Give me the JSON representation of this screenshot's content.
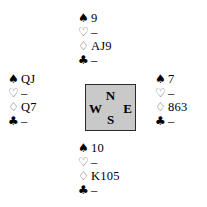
{
  "diagram": {
    "type": "bridge-deal-diagram",
    "suit_order": [
      "spade",
      "heart",
      "diamond",
      "club"
    ],
    "suit_glyphs": {
      "spade": "♠",
      "heart": "♡",
      "diamond": "♢",
      "club": "♣"
    },
    "void_marker": "–"
  },
  "compass": {
    "north_label": "N",
    "west_label": "W",
    "east_label": "E",
    "south_label": "S",
    "fill_color": "#c9c9c9",
    "border_color": "#2b2b2b"
  },
  "hands": {
    "north": {
      "position_label": "North",
      "spade_symbol": "♠",
      "spade_cards": "9",
      "heart_symbol": "♡",
      "heart_cards": "–",
      "diamond_symbol": "♢",
      "diamond_cards": "AJ9",
      "club_symbol": "♣",
      "club_cards": "–"
    },
    "west": {
      "position_label": "West",
      "spade_symbol": "♠",
      "spade_cards": "QJ",
      "heart_symbol": "♡",
      "heart_cards": "–",
      "diamond_symbol": "♢",
      "diamond_cards": "Q7",
      "club_symbol": "♣",
      "club_cards": "–"
    },
    "east": {
      "position_label": "East",
      "spade_symbol": "♠",
      "spade_cards": "7",
      "heart_symbol": "♡",
      "heart_cards": "–",
      "diamond_symbol": "♢",
      "diamond_cards": "863",
      "club_symbol": "♣",
      "club_cards": "–"
    },
    "south": {
      "position_label": "South",
      "spade_symbol": "♠",
      "spade_cards": "10",
      "heart_symbol": "♡",
      "heart_cards": "–",
      "diamond_symbol": "♢",
      "diamond_cards": "K105",
      "club_symbol": "♣",
      "club_cards": "–"
    }
  }
}
